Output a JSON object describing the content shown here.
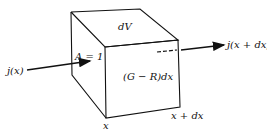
{
  "diagram": {
    "type": "volume-element",
    "labels": {
      "volume": "dV",
      "area": "A = 1",
      "flux_in": "j(x)",
      "flux_out": "j(x + dx)",
      "generation": "(G − R)dx",
      "left_position": "x",
      "right_position": "x + dx"
    },
    "colors": {
      "stroke": "#111111",
      "background": "#ffffff"
    }
  }
}
